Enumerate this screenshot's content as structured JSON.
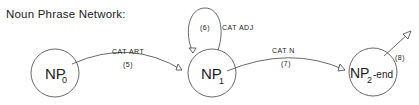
{
  "title": "Noun Phrase Network:",
  "nodes": [
    {
      "id": "np0",
      "label": "NP",
      "sub": "0",
      "suffix": ""
    },
    {
      "id": "np1",
      "label": "NP",
      "sub": "1",
      "suffix": ""
    },
    {
      "id": "np2",
      "label": "NP",
      "sub": "2",
      "suffix": "-end"
    }
  ],
  "arcs": [
    {
      "from": "np0",
      "to": "np1",
      "label": "CAT ART",
      "number": "(5)"
    },
    {
      "from": "np1",
      "to": "np1",
      "label": "CAT ADJ",
      "number": "(6)"
    },
    {
      "from": "np1",
      "to": "np2",
      "label": "CAT N",
      "number": "(7)"
    },
    {
      "from": "np2",
      "to": "exit",
      "label": "",
      "number": "(8)"
    }
  ]
}
